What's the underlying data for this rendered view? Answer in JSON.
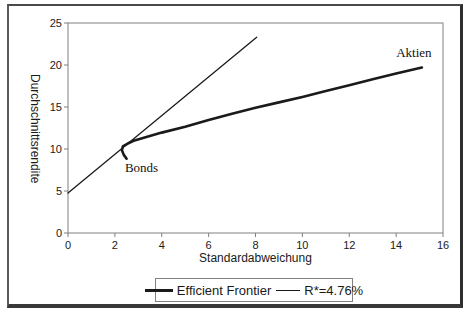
{
  "chart_data": {
    "type": "line",
    "title": "",
    "xlabel": "Standardabweichung",
    "ylabel": "Durchschnittsrendite",
    "xlim": [
      0,
      16
    ],
    "ylim": [
      0,
      25
    ],
    "x_ticks": [
      0,
      2,
      4,
      6,
      8,
      10,
      12,
      14,
      16
    ],
    "y_ticks": [
      0,
      5,
      10,
      15,
      20,
      25
    ],
    "grid": false,
    "legend_position": "bottom-center",
    "axis_color": "#808080",
    "line_color": "#1a1a1a",
    "series": [
      {
        "name": "Efficient Frontier",
        "style": "thick",
        "stroke_width": 2.6,
        "points": [
          [
            2.5,
            8.85
          ],
          [
            2.38,
            9.3
          ],
          [
            2.3,
            9.85
          ],
          [
            2.34,
            10.3
          ],
          [
            2.55,
            10.65
          ],
          [
            2.8,
            10.98
          ],
          [
            3.2,
            11.3
          ],
          [
            4,
            11.95
          ],
          [
            5,
            12.65
          ],
          [
            6,
            13.45
          ],
          [
            7,
            14.2
          ],
          [
            8,
            14.9
          ],
          [
            9,
            15.55
          ],
          [
            10,
            16.2
          ],
          [
            11,
            16.9
          ],
          [
            12,
            17.6
          ],
          [
            13,
            18.3
          ],
          [
            14,
            19.0
          ],
          [
            15.1,
            19.7
          ]
        ]
      },
      {
        "name": "R*=4.76%",
        "style": "thin",
        "stroke_width": 1.3,
        "points": [
          [
            0,
            4.76
          ],
          [
            8.05,
            23.3
          ]
        ]
      }
    ],
    "annotations": [
      {
        "text": "Aktien",
        "x": 14.0,
        "y": 22.4
      },
      {
        "text": "Bonds",
        "x": 2.43,
        "y": 8.7
      }
    ]
  },
  "legend": {
    "items": [
      {
        "label": "Efficient Frontier",
        "style": "thick"
      },
      {
        "label": "R*=4.76%",
        "style": "thin"
      }
    ]
  }
}
